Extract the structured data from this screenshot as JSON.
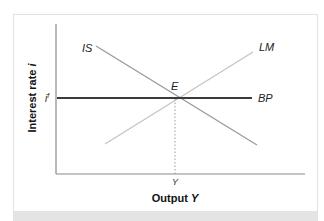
{
  "diagram": {
    "y_axis_label": "Interest rate i",
    "x_axis_label": "Output Y",
    "y_tick_label": "i",
    "y_tick_superscript": "f",
    "x_tick_label": "Y",
    "equilibrium_label": "E",
    "curves": [
      {
        "name": "IS",
        "label": "IS",
        "slope": "downward",
        "color": "#9a9a9a"
      },
      {
        "name": "LM",
        "label": "LM",
        "slope": "upward",
        "color": "#c4c4c4"
      },
      {
        "name": "BP",
        "label": "BP",
        "slope": "horizontal",
        "color": "#3a3a3a"
      }
    ],
    "colors": {
      "axis": "#8a8a8a",
      "bp_line": "#3a3a3a",
      "is_line": "#9a9a9a",
      "lm_line": "#c4c4c4",
      "guide_dotted": "#9a9a9a",
      "frame_border": "#e2e2e2",
      "bottom_band": "#e4e4e4"
    }
  }
}
